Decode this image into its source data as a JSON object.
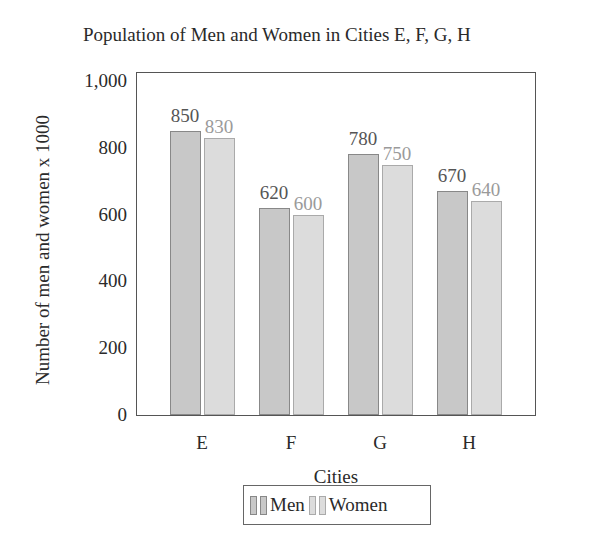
{
  "chart_data": {
    "type": "bar",
    "title": "Population of Men and Women in Cities E, F, G, H",
    "xlabel": "Cities",
    "ylabel": "Number of men and women x 1000",
    "categories": [
      "E",
      "F",
      "G",
      "H"
    ],
    "series": [
      {
        "name": "Men",
        "values": [
          850,
          620,
          780,
          670
        ],
        "color": "#c8c8c8"
      },
      {
        "name": "Women",
        "values": [
          830,
          600,
          750,
          640
        ],
        "color": "#dcdcdc"
      }
    ],
    "ylim": [
      0,
      1000
    ],
    "yticks": [
      "0",
      "200",
      "400",
      "600",
      "800",
      "1,000"
    ],
    "legend_position": "bottom",
    "grid": false
  }
}
